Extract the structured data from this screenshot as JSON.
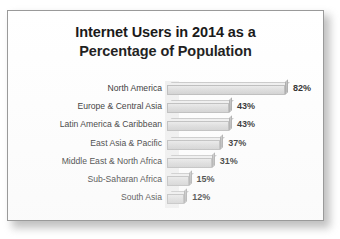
{
  "chart_data": {
    "type": "bar",
    "orientation": "horizontal",
    "title": "Internet Users in 2014 as a Percentage of Population",
    "title_lines": [
      "Internet Users in 2014 as a",
      "Percentage of Population"
    ],
    "xlabel": "",
    "ylabel": "",
    "xlim": [
      0,
      100
    ],
    "grid": false,
    "legend": null,
    "value_suffix": "%",
    "categories": [
      "North America",
      "Europe & Central Asia",
      "Latin America & Caribbean",
      "East Asia & Pacific",
      "Middle East & North Africa",
      "Sub-Saharan Africa",
      "South Asia"
    ],
    "values": [
      82,
      43,
      43,
      37,
      31,
      15,
      12
    ],
    "value_labels": [
      "82%",
      "43%",
      "43%",
      "37%",
      "31%",
      "15%",
      "12%"
    ],
    "series": [
      {
        "name": "Internet users as percentage of population",
        "values": [
          82,
          43,
          43,
          37,
          31,
          15,
          12
        ]
      }
    ]
  },
  "style": {
    "bar_fill": "#dcdcdc",
    "bar_edge": "#b8b8b8",
    "bar_cap": "#b8b8b8",
    "plot_background": "#f0f0f0",
    "card_background": "#ffffff",
    "card_border": "#9a9a9a",
    "text_color": "#1c1c1c",
    "title_color": "#121212"
  }
}
